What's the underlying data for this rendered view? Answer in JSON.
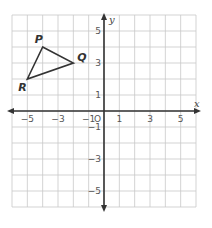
{
  "chart_data": {
    "type": "scatter",
    "title": "",
    "xlabel": "x",
    "ylabel": "y",
    "xlim": [
      -6,
      6
    ],
    "ylim": [
      -6,
      6
    ],
    "grid": true,
    "x_ticks": [
      {
        "value": -5,
        "label": "−5"
      },
      {
        "value": -3,
        "label": "−3"
      },
      {
        "value": -1,
        "label": "−1"
      },
      {
        "value": 1,
        "label": "1"
      },
      {
        "value": 3,
        "label": "3"
      },
      {
        "value": 5,
        "label": "5"
      }
    ],
    "y_ticks": [
      {
        "value": 5,
        "label": "5"
      },
      {
        "value": 3,
        "label": "3"
      },
      {
        "value": 1,
        "label": "1"
      },
      {
        "value": -1,
        "label": "−1"
      },
      {
        "value": -3,
        "label": "−3"
      },
      {
        "value": -5,
        "label": "−5"
      }
    ],
    "origin_label": "O",
    "shape": {
      "type": "triangle",
      "vertices": [
        {
          "name": "P",
          "x": -4,
          "y": 4
        },
        {
          "name": "Q",
          "x": -2,
          "y": 3
        },
        {
          "name": "R",
          "x": -5,
          "y": 2
        }
      ]
    },
    "colors": {
      "grid": "#c8c8c8",
      "axis": "#333333",
      "shape": "#333333"
    }
  }
}
